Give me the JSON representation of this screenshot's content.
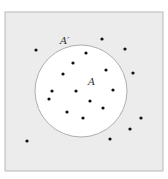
{
  "diagram": {
    "type": "venn-complement",
    "universe": {
      "x": 5,
      "y": 12,
      "width": 158,
      "height": 159,
      "fill": "#ececec",
      "stroke": "#b8b8b8"
    },
    "set": {
      "cx": 81,
      "cy": 91,
      "r": 46,
      "fill": "#ffffff",
      "stroke": "#9a9a9a"
    },
    "labels": {
      "complement": "A′",
      "set": "A"
    },
    "points": [
      [
        36,
        50
      ],
      [
        102,
        39
      ],
      [
        125,
        49
      ],
      [
        86,
        53
      ],
      [
        73,
        63
      ],
      [
        106,
        70
      ],
      [
        63,
        74
      ],
      [
        133,
        73
      ],
      [
        52,
        91
      ],
      [
        76,
        91
      ],
      [
        113,
        90
      ],
      [
        49,
        99
      ],
      [
        90,
        101
      ],
      [
        103,
        108
      ],
      [
        67,
        112
      ],
      [
        83,
        118
      ],
      [
        141,
        118
      ],
      [
        130,
        129
      ],
      [
        27,
        141
      ],
      [
        110,
        139
      ]
    ],
    "point_color": "#111111"
  }
}
